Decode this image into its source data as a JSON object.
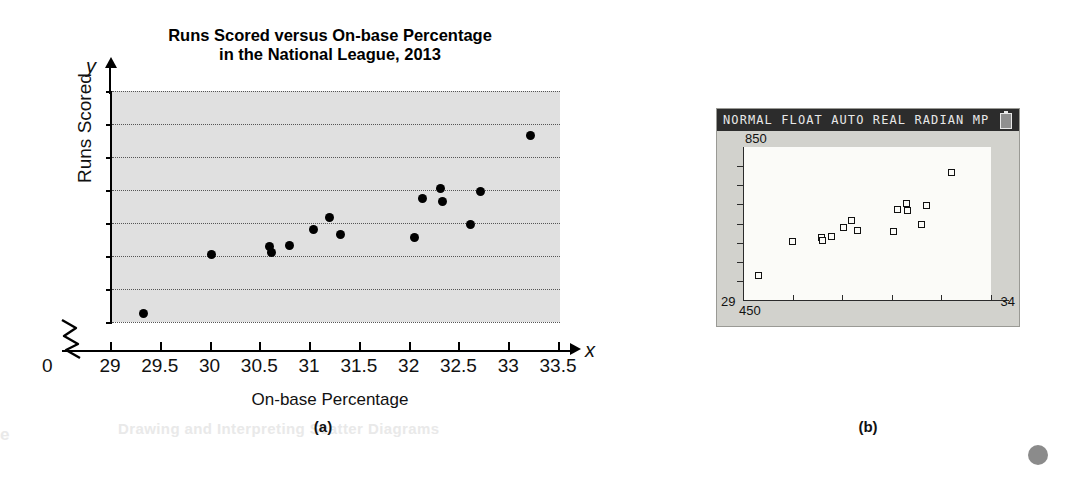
{
  "figure": {
    "panel_a_caption": "(a)",
    "panel_b_caption": "(b)",
    "margin_ghost_left": "e",
    "margin_ghost_text": "Drawing and Interpreting Scatter Diagrams"
  },
  "chart_data": {
    "type": "scatter",
    "title": "Runs Scored versus On-base Percentage",
    "title_line2": "in the National League, 2013",
    "xlabel": "On-base Percentage",
    "ylabel": "Runs Scored",
    "x_symbol": "x",
    "y_symbol": "y",
    "origin_label": "0",
    "axis_break": true,
    "grid": true,
    "xlim": [
      29,
      33.5
    ],
    "ylim": [
      500,
      850
    ],
    "xticks": [
      "29",
      "29.5",
      "30",
      "30.5",
      "31",
      "31.5",
      "32",
      "32.5",
      "33",
      "33.5"
    ],
    "xtick_values": [
      29,
      29.5,
      30,
      30.5,
      31,
      31.5,
      32,
      32.5,
      33,
      33.5
    ],
    "yticks": [
      "500",
      "550",
      "600",
      "650",
      "700",
      "750",
      "800",
      "850"
    ],
    "ytick_values": [
      500,
      550,
      600,
      650,
      700,
      750,
      800,
      850
    ],
    "points": [
      {
        "x": 29.32,
        "y": 513
      },
      {
        "x": 30.0,
        "y": 603
      },
      {
        "x": 30.58,
        "y": 614
      },
      {
        "x": 30.6,
        "y": 606
      },
      {
        "x": 30.78,
        "y": 616
      },
      {
        "x": 31.02,
        "y": 640
      },
      {
        "x": 31.18,
        "y": 658
      },
      {
        "x": 31.3,
        "y": 633
      },
      {
        "x": 32.04,
        "y": 628
      },
      {
        "x": 32.12,
        "y": 687
      },
      {
        "x": 32.3,
        "y": 703
      },
      {
        "x": 32.32,
        "y": 683
      },
      {
        "x": 32.6,
        "y": 648
      },
      {
        "x": 32.7,
        "y": 698
      },
      {
        "x": 33.2,
        "y": 783
      }
    ]
  },
  "calculator": {
    "status_text": "NORMAL FLOAT AUTO REAL RADIAN MP",
    "battery_icon": "battery-icon",
    "ymax_label": "850",
    "ymin_label": "450",
    "xmin_label": "29",
    "xmax_label": "34",
    "window": {
      "xmin": 29,
      "xmax": 34,
      "ymin": 450,
      "ymax": 850
    },
    "points": [
      {
        "x": 29.32,
        "y": 513
      },
      {
        "x": 30.0,
        "y": 603
      },
      {
        "x": 30.58,
        "y": 614
      },
      {
        "x": 30.6,
        "y": 606
      },
      {
        "x": 30.78,
        "y": 616
      },
      {
        "x": 31.02,
        "y": 640
      },
      {
        "x": 31.18,
        "y": 658
      },
      {
        "x": 31.3,
        "y": 633
      },
      {
        "x": 32.04,
        "y": 628
      },
      {
        "x": 32.12,
        "y": 687
      },
      {
        "x": 32.3,
        "y": 703
      },
      {
        "x": 32.32,
        "y": 683
      },
      {
        "x": 32.6,
        "y": 648
      },
      {
        "x": 32.7,
        "y": 698
      },
      {
        "x": 33.2,
        "y": 783
      }
    ]
  }
}
